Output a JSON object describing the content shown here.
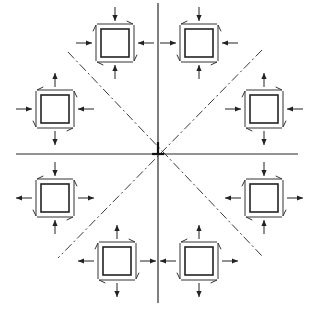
{
  "diagram": {
    "title": "",
    "center": [
      158,
      154
    ],
    "axes": {
      "horizontal": {
        "x1": 16,
        "x2": 298,
        "y": 154
      },
      "vertical": {
        "x": 158,
        "y1": 3,
        "y2": 303
      },
      "diagonal_1": {
        "x1": 68,
        "y1": 52,
        "x2": 262,
        "y2": 256
      },
      "diagonal_2": {
        "x1": 262,
        "y1": 50,
        "x2": 58,
        "y2": 258
      }
    },
    "colors": {
      "line": "#222222",
      "background": "#ffffff"
    },
    "elements": [
      {
        "id": "top-left",
        "cx": 115,
        "cy": 43,
        "size": 28,
        "normal_x": "in",
        "normal_y": "in",
        "shear": "cw"
      },
      {
        "id": "top-right",
        "cx": 199,
        "cy": 43,
        "size": 28,
        "normal_x": "in",
        "normal_y": "in",
        "shear": "ccw"
      },
      {
        "id": "left-upper",
        "cx": 55,
        "cy": 109,
        "size": 28,
        "normal_x": "in",
        "normal_y": "out",
        "shear": "ccw"
      },
      {
        "id": "right-upper",
        "cx": 264,
        "cy": 109,
        "size": 28,
        "normal_x": "in",
        "normal_y": "out",
        "shear": "cw"
      },
      {
        "id": "left-lower",
        "cx": 55,
        "cy": 198,
        "size": 28,
        "normal_x": "out",
        "normal_y": "in",
        "shear": "ccw"
      },
      {
        "id": "right-lower",
        "cx": 264,
        "cy": 198,
        "size": 28,
        "normal_x": "out",
        "normal_y": "in",
        "shear": "cw"
      },
      {
        "id": "bottom-left",
        "cx": 117,
        "cy": 261,
        "size": 28,
        "normal_x": "out",
        "normal_y": "out",
        "shear": "cw"
      },
      {
        "id": "bottom-right",
        "cx": 199,
        "cy": 261,
        "size": 28,
        "normal_x": "out",
        "normal_y": "out",
        "shear": "ccw"
      }
    ]
  }
}
